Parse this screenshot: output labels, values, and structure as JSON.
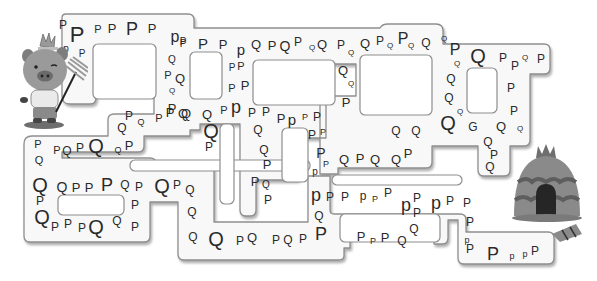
{
  "puzzle": {
    "type": "letter-maze",
    "instruction_hidden": "",
    "start_character": "pig-with-rake",
    "goal": "straw-hut",
    "colors": {
      "path_fill": "#f7f7f7",
      "path_stroke": "#9a9a9a",
      "path_shadow": "#c4c4c4",
      "letter": "#2a2a2a",
      "background": "#ffffff"
    }
  },
  "letters": [
    {
      "c": "P",
      "x": 63,
      "y": 25,
      "s": 12
    },
    {
      "c": "P",
      "x": 77,
      "y": 35,
      "s": 22
    },
    {
      "c": "P",
      "x": 98,
      "y": 29,
      "s": 11
    },
    {
      "c": "P",
      "x": 112,
      "y": 28,
      "s": 13
    },
    {
      "c": "P",
      "x": 132,
      "y": 29,
      "s": 18
    },
    {
      "c": "P",
      "x": 152,
      "y": 28,
      "s": 13
    },
    {
      "c": "p",
      "x": 175,
      "y": 37,
      "s": 16
    },
    {
      "c": "P",
      "x": 183,
      "y": 44,
      "s": 10
    },
    {
      "c": "p",
      "x": 66,
      "y": 49,
      "s": 10
    },
    {
      "c": "P",
      "x": 82,
      "y": 54,
      "s": 10
    },
    {
      "c": "P",
      "x": 183,
      "y": 42,
      "s": 10
    },
    {
      "c": "P",
      "x": 203,
      "y": 43,
      "s": 15
    },
    {
      "c": "P",
      "x": 223,
      "y": 44,
      "s": 13
    },
    {
      "c": "p",
      "x": 241,
      "y": 49,
      "s": 15
    },
    {
      "c": "Q",
      "x": 256,
      "y": 44,
      "s": 13
    },
    {
      "c": "P",
      "x": 272,
      "y": 45,
      "s": 13
    },
    {
      "c": "Q",
      "x": 285,
      "y": 46,
      "s": 14
    },
    {
      "c": "P",
      "x": 298,
      "y": 42,
      "s": 12
    },
    {
      "c": "Q",
      "x": 312,
      "y": 48,
      "s": 8
    },
    {
      "c": "Q",
      "x": 322,
      "y": 44,
      "s": 13
    },
    {
      "c": "P",
      "x": 341,
      "y": 45,
      "s": 12
    },
    {
      "c": "Q",
      "x": 351,
      "y": 53,
      "s": 8
    },
    {
      "c": "Q",
      "x": 365,
      "y": 43,
      "s": 13
    },
    {
      "c": "P",
      "x": 380,
      "y": 41,
      "s": 12
    },
    {
      "c": "Q",
      "x": 390,
      "y": 46,
      "s": 8
    },
    {
      "c": "P",
      "x": 403,
      "y": 39,
      "s": 16
    },
    {
      "c": "Q",
      "x": 411,
      "y": 46,
      "s": 8
    },
    {
      "c": "Q",
      "x": 426,
      "y": 43,
      "s": 12
    },
    {
      "c": "Q",
      "x": 444,
      "y": 39,
      "s": 8
    },
    {
      "c": "P",
      "x": 455,
      "y": 50,
      "s": 16
    },
    {
      "c": "Q",
      "x": 478,
      "y": 56,
      "s": 20
    },
    {
      "c": "Q",
      "x": 457,
      "y": 64,
      "s": 8
    },
    {
      "c": "P",
      "x": 503,
      "y": 58,
      "s": 12
    },
    {
      "c": "P",
      "x": 515,
      "y": 66,
      "s": 12
    },
    {
      "c": "Q",
      "x": 525,
      "y": 58,
      "s": 8
    },
    {
      "c": "P",
      "x": 541,
      "y": 59,
      "s": 12
    },
    {
      "c": "Q",
      "x": 172,
      "y": 60,
      "s": 10
    },
    {
      "c": "P",
      "x": 168,
      "y": 75,
      "s": 11
    },
    {
      "c": "Q",
      "x": 180,
      "y": 78,
      "s": 13
    },
    {
      "c": "Q",
      "x": 172,
      "y": 91,
      "s": 8
    },
    {
      "c": "P",
      "x": 172,
      "y": 108,
      "s": 13
    },
    {
      "c": "Q",
      "x": 183,
      "y": 113,
      "s": 13
    },
    {
      "c": "P",
      "x": 232,
      "y": 68,
      "s": 10
    },
    {
      "c": "P",
      "x": 241,
      "y": 66,
      "s": 11
    },
    {
      "c": "P",
      "x": 232,
      "y": 88,
      "s": 11
    },
    {
      "c": "P",
      "x": 245,
      "y": 85,
      "s": 13
    },
    {
      "c": "Q",
      "x": 343,
      "y": 70,
      "s": 13
    },
    {
      "c": "Q",
      "x": 351,
      "y": 84,
      "s": 8
    },
    {
      "c": "P",
      "x": 346,
      "y": 102,
      "s": 13
    },
    {
      "c": "Q",
      "x": 451,
      "y": 79,
      "s": 12
    },
    {
      "c": "Q",
      "x": 449,
      "y": 98,
      "s": 12
    },
    {
      "c": "Q",
      "x": 460,
      "y": 112,
      "s": 8
    },
    {
      "c": "P",
      "x": 511,
      "y": 88,
      "s": 12
    },
    {
      "c": "P",
      "x": 514,
      "y": 111,
      "s": 12
    },
    {
      "c": "Q",
      "x": 448,
      "y": 123,
      "s": 20
    },
    {
      "c": "G",
      "x": 473,
      "y": 127,
      "s": 12
    },
    {
      "c": "Q",
      "x": 501,
      "y": 126,
      "s": 13
    },
    {
      "c": "Q",
      "x": 520,
      "y": 129,
      "s": 8
    },
    {
      "c": "Q",
      "x": 122,
      "y": 128,
      "s": 12
    },
    {
      "c": "P",
      "x": 129,
      "y": 116,
      "s": 12
    },
    {
      "c": "Q",
      "x": 141,
      "y": 122,
      "s": 9
    },
    {
      "c": "P",
      "x": 159,
      "y": 118,
      "s": 11
    },
    {
      "c": "P",
      "x": 170,
      "y": 112,
      "s": 13
    },
    {
      "c": "Q",
      "x": 186,
      "y": 113,
      "s": 13
    },
    {
      "c": "Q",
      "x": 207,
      "y": 114,
      "s": 13
    },
    {
      "c": "P",
      "x": 224,
      "y": 110,
      "s": 11
    },
    {
      "c": "p",
      "x": 236,
      "y": 107,
      "s": 18
    },
    {
      "c": "P",
      "x": 252,
      "y": 113,
      "s": 12
    },
    {
      "c": "P",
      "x": 266,
      "y": 112,
      "s": 12
    },
    {
      "c": "P",
      "x": 281,
      "y": 118,
      "s": 13
    },
    {
      "c": "p",
      "x": 292,
      "y": 119,
      "s": 15
    },
    {
      "c": "P",
      "x": 305,
      "y": 117,
      "s": 9
    },
    {
      "c": "P",
      "x": 317,
      "y": 117,
      "s": 12
    },
    {
      "c": "Q",
      "x": 211,
      "y": 131,
      "s": 20
    },
    {
      "c": "P",
      "x": 209,
      "y": 147,
      "s": 12
    },
    {
      "c": "Q",
      "x": 258,
      "y": 130,
      "s": 12
    },
    {
      "c": "Q",
      "x": 264,
      "y": 150,
      "s": 12
    },
    {
      "c": "P",
      "x": 267,
      "y": 164,
      "s": 13
    },
    {
      "c": "P",
      "x": 255,
      "y": 181,
      "s": 13
    },
    {
      "c": "Q",
      "x": 266,
      "y": 185,
      "s": 10
    },
    {
      "c": "P",
      "x": 268,
      "y": 200,
      "s": 12
    },
    {
      "c": "P",
      "x": 312,
      "y": 135,
      "s": 12
    },
    {
      "c": "P",
      "x": 323,
      "y": 132,
      "s": 9
    },
    {
      "c": "P",
      "x": 321,
      "y": 153,
      "s": 14
    },
    {
      "c": "P",
      "x": 326,
      "y": 164,
      "s": 9
    },
    {
      "c": "p",
      "x": 315,
      "y": 172,
      "s": 10
    },
    {
      "c": "Q",
      "x": 344,
      "y": 159,
      "s": 13
    },
    {
      "c": "P",
      "x": 360,
      "y": 158,
      "s": 13
    },
    {
      "c": "Q",
      "x": 375,
      "y": 159,
      "s": 13
    },
    {
      "c": "Q",
      "x": 396,
      "y": 159,
      "s": 13
    },
    {
      "c": "P",
      "x": 408,
      "y": 153,
      "s": 13
    },
    {
      "c": "Q",
      "x": 396,
      "y": 131,
      "s": 12
    },
    {
      "c": "Q",
      "x": 416,
      "y": 131,
      "s": 12
    },
    {
      "c": "Q",
      "x": 488,
      "y": 142,
      "s": 12
    },
    {
      "c": "P",
      "x": 494,
      "y": 155,
      "s": 12
    },
    {
      "c": "Q",
      "x": 490,
      "y": 167,
      "s": 12
    },
    {
      "c": "P",
      "x": 38,
      "y": 144,
      "s": 11
    },
    {
      "c": "P",
      "x": 57,
      "y": 150,
      "s": 11
    },
    {
      "c": "Q",
      "x": 67,
      "y": 151,
      "s": 12
    },
    {
      "c": "P",
      "x": 80,
      "y": 148,
      "s": 12
    },
    {
      "c": "Q",
      "x": 96,
      "y": 146,
      "s": 20
    },
    {
      "c": "Q",
      "x": 118,
      "y": 150,
      "s": 9
    },
    {
      "c": "P",
      "x": 129,
      "y": 145,
      "s": 13
    },
    {
      "c": "Q",
      "x": 39,
      "y": 160,
      "s": 11
    },
    {
      "c": "Q",
      "x": 40,
      "y": 185,
      "s": 20
    },
    {
      "c": "Q",
      "x": 62,
      "y": 187,
      "s": 14
    },
    {
      "c": "P",
      "x": 76,
      "y": 187,
      "s": 13
    },
    {
      "c": "P",
      "x": 89,
      "y": 187,
      "s": 13
    },
    {
      "c": "P",
      "x": 107,
      "y": 185,
      "s": 18
    },
    {
      "c": "Q",
      "x": 125,
      "y": 185,
      "s": 12
    },
    {
      "c": "P",
      "x": 139,
      "y": 187,
      "s": 12
    },
    {
      "c": "Q",
      "x": 162,
      "y": 186,
      "s": 20
    },
    {
      "c": "P",
      "x": 177,
      "y": 185,
      "s": 12
    },
    {
      "c": "Q",
      "x": 190,
      "y": 190,
      "s": 12
    },
    {
      "c": "P",
      "x": 40,
      "y": 201,
      "s": 12
    },
    {
      "c": "P",
      "x": 135,
      "y": 205,
      "s": 12
    },
    {
      "c": "Q",
      "x": 192,
      "y": 212,
      "s": 12
    },
    {
      "c": "Q",
      "x": 42,
      "y": 217,
      "s": 20
    },
    {
      "c": "P",
      "x": 55,
      "y": 227,
      "s": 12
    },
    {
      "c": "P",
      "x": 68,
      "y": 224,
      "s": 12
    },
    {
      "c": "P",
      "x": 82,
      "y": 228,
      "s": 12
    },
    {
      "c": "Q",
      "x": 96,
      "y": 227,
      "s": 20
    },
    {
      "c": "Q",
      "x": 117,
      "y": 221,
      "s": 12
    },
    {
      "c": "P",
      "x": 135,
      "y": 227,
      "s": 12
    },
    {
      "c": "Q",
      "x": 193,
      "y": 237,
      "s": 12
    },
    {
      "c": "Q",
      "x": 216,
      "y": 239,
      "s": 20
    },
    {
      "c": "P",
      "x": 240,
      "y": 241,
      "s": 12
    },
    {
      "c": "Q",
      "x": 252,
      "y": 237,
      "s": 13
    },
    {
      "c": "P",
      "x": 276,
      "y": 240,
      "s": 12
    },
    {
      "c": "Q",
      "x": 288,
      "y": 240,
      "s": 12
    },
    {
      "c": "P",
      "x": 303,
      "y": 239,
      "s": 12
    },
    {
      "c": "P",
      "x": 321,
      "y": 234,
      "s": 18
    },
    {
      "c": "p",
      "x": 316,
      "y": 195,
      "s": 18
    },
    {
      "c": "P",
      "x": 330,
      "y": 197,
      "s": 12
    },
    {
      "c": "P",
      "x": 345,
      "y": 197,
      "s": 12
    },
    {
      "c": "p",
      "x": 363,
      "y": 196,
      "s": 12
    },
    {
      "c": "P",
      "x": 375,
      "y": 199,
      "s": 9
    },
    {
      "c": "P",
      "x": 388,
      "y": 193,
      "s": 12
    },
    {
      "c": "Q",
      "x": 319,
      "y": 216,
      "s": 12
    },
    {
      "c": "p",
      "x": 406,
      "y": 205,
      "s": 18
    },
    {
      "c": "P",
      "x": 417,
      "y": 198,
      "s": 12
    },
    {
      "c": "P",
      "x": 417,
      "y": 213,
      "s": 12
    },
    {
      "c": "Q",
      "x": 414,
      "y": 229,
      "s": 12
    },
    {
      "c": "Q",
      "x": 402,
      "y": 241,
      "s": 12
    },
    {
      "c": "p",
      "x": 436,
      "y": 203,
      "s": 18
    },
    {
      "c": "P",
      "x": 450,
      "y": 201,
      "s": 12
    },
    {
      "c": "P",
      "x": 467,
      "y": 203,
      "s": 12
    },
    {
      "c": "P",
      "x": 361,
      "y": 236,
      "s": 13
    },
    {
      "c": "P",
      "x": 373,
      "y": 241,
      "s": 9
    },
    {
      "c": "P",
      "x": 385,
      "y": 237,
      "s": 13
    },
    {
      "c": "P",
      "x": 470,
      "y": 222,
      "s": 12
    },
    {
      "c": "p",
      "x": 467,
      "y": 240,
      "s": 9
    },
    {
      "c": "P",
      "x": 470,
      "y": 249,
      "s": 12
    },
    {
      "c": "P",
      "x": 493,
      "y": 254,
      "s": 18
    },
    {
      "c": "p",
      "x": 512,
      "y": 256,
      "s": 9
    },
    {
      "c": "p",
      "x": 525,
      "y": 254,
      "s": 9
    },
    {
      "c": "P",
      "x": 535,
      "y": 251,
      "s": 12
    }
  ]
}
